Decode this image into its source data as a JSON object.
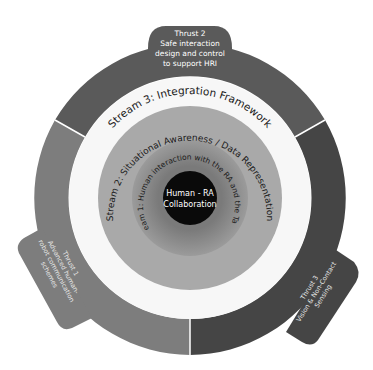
{
  "diagram": {
    "core": {
      "line1": "Human - RA",
      "line2": "Collaboration",
      "color": "#0a0a0a"
    },
    "streams": [
      {
        "id": "stream1",
        "label": "Stream 1: Human interaction with the RA and the Task",
        "color": "#8c8c8c"
      },
      {
        "id": "stream2",
        "label": "Stream 2: Situational Awareness / Data Representation",
        "color": "#a9a9a9"
      },
      {
        "id": "stream3",
        "label": "Stream 3: Integration Framework",
        "color": "#f7f7f7"
      }
    ],
    "thrusts": [
      {
        "id": "thrust1",
        "title": "Thrust 1",
        "lines": [
          "Advanced human-",
          "robot communication",
          "schemes"
        ],
        "color": "#7d7d7d"
      },
      {
        "id": "thrust2",
        "title": "Thrust 2",
        "lines": [
          "Safe interaction",
          "design and control",
          "to support HRI"
        ],
        "color": "#5a5a5a"
      },
      {
        "id": "thrust3",
        "title": "Thrust 3",
        "lines": [
          "Vision & Non-Contact",
          "Sensing"
        ],
        "color": "#454545"
      }
    ]
  }
}
